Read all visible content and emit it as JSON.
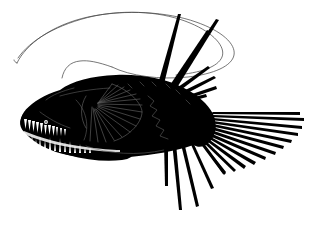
{
  "image": {
    "kind": "natural-image",
    "subject_name": "anglerfish",
    "style": "black-silhouette-line-illustration",
    "title": "Deep-sea anglerfish silhouette",
    "width": 320,
    "height": 228,
    "background_color": "#ffffff"
  },
  "palette": {
    "body_fill": "#000000",
    "background": "#ffffff",
    "tooth_fill": "#ffffff",
    "filament_stroke": "#4a4a4a",
    "fin_ray_detail": "#5c5c5c",
    "marking_stroke": "#6b6b6b",
    "eye_fill": "#ffffff"
  },
  "parts": {
    "body": {
      "label": "body",
      "fill": "#000000",
      "path": "M 62 109 C 58 101 60 93 68 87 C 80 78 98 74 118 74 C 140 74 162 78 180 86 C 196 93 206 101 212 110 C 217 117 218 124 216 131 C 213 140 205 146 194 149 C 180 153 162 155 142 156 C 120 157 98 156 80 152 C 66 149 58 143 55 135 C 52 127 54 117 62 109 Z"
    },
    "head": {
      "label": "head",
      "fill": "#000000",
      "path": "M 60 88 C 48 92 38 99 30 106 C 22 113 18 120 20 126 C 22 133 30 139 42 145 C 56 152 74 157 92 159 C 106 160 118 159 126 156 L 120 130 L 96 112 L 76 96 Z"
    },
    "jaw_upper": {
      "label": "upper-jaw",
      "fill": "#000000"
    },
    "jaw_lower": {
      "label": "lower-jaw",
      "fill": "#000000"
    },
    "eye": {
      "label": "eye",
      "fill": "#ffffff",
      "cx": 46,
      "cy": 122,
      "r": 2.0
    },
    "teeth_upper": {
      "label": "upper-teeth",
      "count": 11,
      "fill": "#ffffff",
      "start_x": 25,
      "end_x": 60,
      "y": 126
    },
    "teeth_lower": {
      "label": "lower-teeth",
      "count": 13,
      "fill": "#ffffff",
      "start_x": 28,
      "end_x": 82,
      "y": 142
    },
    "illicium": {
      "label": "illicium-filament-loop",
      "stroke": "#4a4a4a",
      "stroke_width": 0.8,
      "description": "long thin looping lure filament arcing above the body"
    },
    "dorsal_spines": {
      "label": "dorsal-spines",
      "count": 2,
      "fill": "#000000",
      "description": "two thick dark spines rising up and to the left"
    },
    "dorsal_fan": {
      "label": "dorsal-fin-rays",
      "count": 6,
      "fill": "#000000"
    },
    "pectoral_fin": {
      "label": "pectoral-fin",
      "ray_count": 16,
      "fill": "#000000",
      "ray_stroke": "#5c5c5c",
      "origin_x": 98,
      "origin_y": 103
    },
    "anal_fin": {
      "label": "anal-fin-rays",
      "count": 4,
      "fill": "#000000",
      "longest_length": 66
    },
    "caudal_fin": {
      "label": "caudal-fin",
      "ray_count": 12,
      "fill": "#000000",
      "origin_x": 212,
      "origin_y": 124,
      "extent_x": 306
    },
    "lateral_markings": {
      "label": "lateral-line-markings",
      "stroke": "#6b6b6b",
      "description": "faint zigzag lateral line and scale hatching on flank"
    }
  },
  "accessibility": {
    "alt_text": "Black silhouette illustration of a deep-sea anglerfish with a long looping lure filament, large fang-like teeth, fanned pectoral fin, dorsal spines and a spreading tail fin."
  }
}
